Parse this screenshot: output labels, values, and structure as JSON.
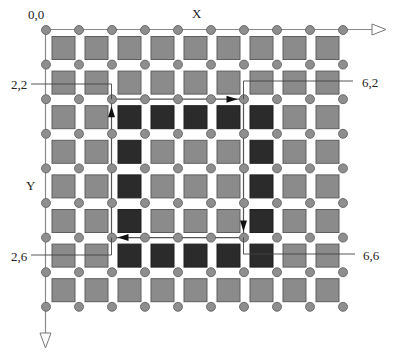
{
  "diagram": {
    "origin_label": "0,0",
    "x_axis_label": "X",
    "y_axis_label": "Y",
    "grid": {
      "dot_columns": 10,
      "dot_rows": 9,
      "square_columns": 9,
      "square_rows": 8,
      "dot_x0": 46,
      "dot_y0": 30,
      "dot_dx": 33,
      "dot_dy": 34.6
    },
    "highlighted_ring": {
      "col_start": 2,
      "col_end": 6,
      "row_start": 2,
      "row_end": 6
    },
    "path": {
      "corners": [
        {
          "label": "2,2",
          "col": 2,
          "row": 2
        },
        {
          "label": "6,2",
          "col": 6,
          "row": 2
        },
        {
          "label": "6,6",
          "col": 6,
          "row": 6
        },
        {
          "label": "2,6",
          "col": 2,
          "row": 6
        }
      ],
      "direction": "clockwise: (2,6) up to (2,2), right to (6,2), down to (6,6), left to (2,6)"
    },
    "colors": {
      "square": "#8b8b8b",
      "square_border": "#5e5e5e",
      "dark_square": "#2b2b2b",
      "dot": "#8e8e8e",
      "dot_border": "#5a5a5a",
      "line": "#7a7a7a",
      "path_line": "#555555",
      "arrow": "#111111"
    }
  }
}
